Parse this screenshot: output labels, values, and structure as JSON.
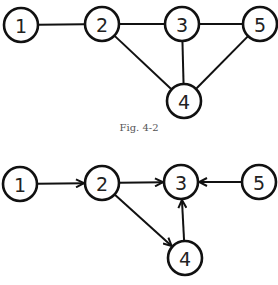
{
  "figures": [
    {
      "id": "undirected",
      "caption": "Fig. 4-2",
      "directed": false,
      "nodes": [
        {
          "label": "1",
          "x": 21,
          "y": 25
        },
        {
          "label": "2",
          "x": 102,
          "y": 24
        },
        {
          "label": "3",
          "x": 182,
          "y": 24
        },
        {
          "label": "5",
          "x": 260,
          "y": 24
        },
        {
          "label": "4",
          "x": 184,
          "y": 101
        }
      ],
      "edges": [
        [
          "1",
          "2"
        ],
        [
          "2",
          "3"
        ],
        [
          "3",
          "5"
        ],
        [
          "2",
          "4"
        ],
        [
          "3",
          "4"
        ],
        [
          "5",
          "4"
        ]
      ]
    },
    {
      "id": "directed",
      "caption": "",
      "directed": true,
      "nodes": [
        {
          "label": "1",
          "x": 20,
          "y": 184
        },
        {
          "label": "2",
          "x": 102,
          "y": 183
        },
        {
          "label": "3",
          "x": 181,
          "y": 182
        },
        {
          "label": "5",
          "x": 259,
          "y": 182
        },
        {
          "label": "4",
          "x": 185,
          "y": 258
        }
      ],
      "edges": [
        [
          "1",
          "2"
        ],
        [
          "2",
          "3"
        ],
        [
          "5",
          "3"
        ],
        [
          "2",
          "4"
        ],
        [
          "4",
          "3"
        ]
      ]
    }
  ],
  "node_radius": 17
}
